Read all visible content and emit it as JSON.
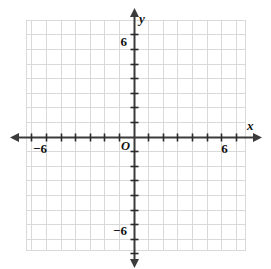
{
  "figure": {
    "kind": "cartesian-coordinate-grid",
    "width": 271,
    "height": 269,
    "background_color": "#ffffff"
  },
  "chart_data": {
    "type": "scatter",
    "title": "",
    "subtitle": "",
    "xlabel": "x",
    "ylabel": "y",
    "xlim": [
      -7,
      7
    ],
    "ylim": [
      -8,
      8
    ],
    "x_ticks": [
      -7,
      -6,
      -5,
      -4,
      -3,
      -2,
      -1,
      0,
      1,
      2,
      3,
      4,
      5,
      6,
      7
    ],
    "y_ticks": [
      -8,
      -7,
      -6,
      -5,
      -4,
      -3,
      -2,
      -1,
      0,
      1,
      2,
      3,
      4,
      5,
      6,
      7
    ],
    "x_tick_labels": [
      "-6",
      "6"
    ],
    "y_tick_labels": [
      "6",
      "-6"
    ],
    "labeled_x_values": [
      -6,
      6
    ],
    "labeled_y_values": [
      6,
      -6
    ],
    "grid": true,
    "grid_spacing": 1,
    "grid_color": "#d9d9d9",
    "axis_color": "#3b3b3b",
    "legend": "none",
    "series": [],
    "values": [],
    "categories": [],
    "annotations": []
  },
  "axes": {
    "x_axis_name": "x",
    "y_axis_name": "y",
    "origin_label": "O",
    "x_label_negative": "−6",
    "x_label_positive": "6",
    "y_label_positive": "6",
    "y_label_negative": "−6",
    "arrow_heads": [
      "left",
      "right",
      "up",
      "down"
    ]
  },
  "colors": {
    "grid_line": "#d9d9d9",
    "axis_line": "#3b3b3b",
    "tick_mark": "#2b2b2b",
    "text": "#111111",
    "background": "#ffffff"
  },
  "geometry": {
    "origin_px": {
      "x": 133.5,
      "y": 136.5
    },
    "unit_px": 14.6,
    "grid_left_px": 26,
    "grid_right_px": 245,
    "grid_top_px": 20,
    "grid_bottom_px": 250
  }
}
